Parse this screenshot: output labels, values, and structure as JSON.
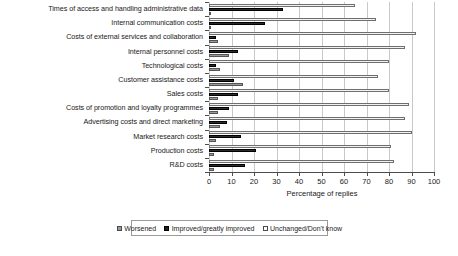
{
  "chart_data": {
    "type": "bar",
    "orientation": "horizontal",
    "title": "",
    "xlabel": "Percentage of replies",
    "ylabel": "",
    "xlim": [
      0,
      100
    ],
    "xticks": [
      0,
      10,
      20,
      30,
      40,
      50,
      60,
      70,
      80,
      90,
      100
    ],
    "grid": true,
    "legend_position": "bottom",
    "categories": [
      "Times of access and handling administrative data",
      "Internal communication costs",
      "Costs of external services and collaboration",
      "Internal personnel costs",
      "Technological costs",
      "Customer assistance costs",
      "Sales costs",
      "Costs of promotion and loyalty programmes",
      "Advertising costs and direct marketing",
      "Market research costs",
      "Production costs",
      "R&D costs"
    ],
    "series": [
      {
        "name": "Worsened",
        "color": "#9a9a9a",
        "values": [
          1,
          1,
          4,
          9,
          5,
          15,
          4,
          4,
          5,
          3,
          2,
          2
        ]
      },
      {
        "name": "Improved/greatly improved",
        "color": "#2b2b2b",
        "values": [
          33,
          25,
          3,
          13,
          3,
          11,
          13,
          9,
          8,
          14,
          21,
          16
        ]
      },
      {
        "name": "Unchanged/Don't know",
        "color": "#f2f2f2",
        "values": [
          65,
          74,
          92,
          87,
          80,
          75,
          80,
          89,
          87,
          90,
          81,
          82
        ]
      }
    ]
  },
  "axis": {
    "x_title": "Percentage of replies",
    "tick_labels": [
      "0",
      "10",
      "20",
      "30",
      "40",
      "50",
      "60",
      "70",
      "80",
      "90",
      "100"
    ]
  },
  "legend": {
    "items": [
      {
        "label": "Worsened",
        "key": "worsened"
      },
      {
        "label": "Improved/greatly improved",
        "key": "improved"
      },
      {
        "label": "Unchanged/Don't know",
        "key": "unchanged"
      }
    ]
  }
}
